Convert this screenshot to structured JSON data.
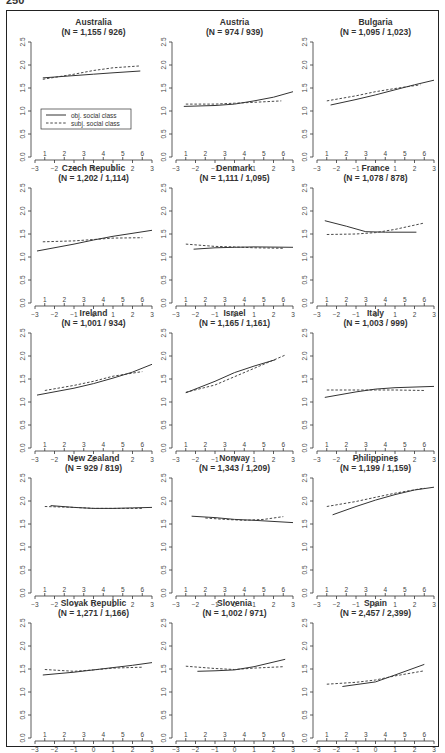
{
  "page": {
    "number": "250"
  },
  "legend": {
    "obj_label": "obj. social class",
    "subj_label": "subj. social class"
  },
  "axes": {
    "x_ticks": [
      "−3",
      "−2",
      "−1",
      "0",
      "1",
      "2",
      "3"
    ],
    "x_values": [
      -3,
      -2,
      -1,
      0,
      1,
      2,
      3
    ],
    "y_ticks": [
      "0.0",
      "0.5",
      "1.0",
      "1.5",
      "2.0",
      "2.5"
    ],
    "y_values": [
      0,
      0.5,
      1.0,
      1.5,
      2.0,
      2.5
    ],
    "class_ticks": [
      "1",
      "2",
      "3",
      "4",
      "5",
      "6"
    ],
    "class_positions": [
      -2.5,
      -1.5,
      -0.5,
      0.5,
      1.5,
      2.5
    ]
  },
  "chart_data": {
    "type": "line",
    "layout": "5x3 small multiples",
    "xlim": [
      -3,
      3
    ],
    "ylim": [
      0,
      2.5
    ],
    "secondary_x_ticks": [
      1,
      2,
      3,
      4,
      5,
      6
    ],
    "legend_position": "inside first panel, lower-middle",
    "series_names": [
      "obj. social class",
      "subj. social class"
    ],
    "panels": [
      {
        "title": "Australia",
        "n": "(N = 1,155 / 926)",
        "obj": [
          [
            -2.6,
            1.72
          ],
          [
            -1,
            1.77
          ],
          [
            0,
            1.8
          ],
          [
            1,
            1.83
          ],
          [
            2.4,
            1.87
          ]
        ],
        "subj": [
          [
            -2.6,
            1.69
          ],
          [
            -1,
            1.8
          ],
          [
            0,
            1.88
          ],
          [
            1,
            1.94
          ],
          [
            2.4,
            1.98
          ]
        ]
      },
      {
        "title": "Austria",
        "n": "(N = 974 / 939)",
        "obj": [
          [
            -2.6,
            1.1
          ],
          [
            -1,
            1.12
          ],
          [
            0,
            1.15
          ],
          [
            1,
            1.22
          ],
          [
            2,
            1.3
          ],
          [
            3,
            1.42
          ]
        ],
        "subj": [
          [
            -2.5,
            1.15
          ],
          [
            -1,
            1.15
          ],
          [
            0,
            1.17
          ],
          [
            1,
            1.19
          ],
          [
            2.4,
            1.22
          ]
        ]
      },
      {
        "title": "Bulgaria",
        "n": "(N = 1,095 / 1,023)",
        "obj": [
          [
            -2.3,
            1.13
          ],
          [
            -1,
            1.25
          ],
          [
            0,
            1.35
          ],
          [
            1,
            1.46
          ],
          [
            2,
            1.57
          ],
          [
            3,
            1.67
          ]
        ],
        "subj": [
          [
            -2.5,
            1.22
          ],
          [
            -1,
            1.33
          ],
          [
            0,
            1.42
          ],
          [
            1,
            1.49
          ],
          [
            2.3,
            1.57
          ]
        ]
      },
      {
        "title": "Czech Republic",
        "n": "(N = 1,202 / 1,114)",
        "obj": [
          [
            -2.9,
            1.13
          ],
          [
            -1,
            1.28
          ],
          [
            0,
            1.37
          ],
          [
            1,
            1.45
          ],
          [
            3,
            1.58
          ]
        ],
        "subj": [
          [
            -2.6,
            1.33
          ],
          [
            -1,
            1.35
          ],
          [
            0,
            1.38
          ],
          [
            1,
            1.41
          ],
          [
            2.5,
            1.42
          ]
        ]
      },
      {
        "title": "Denmark",
        "n": "(N = 1,111 / 1,095)",
        "obj": [
          [
            -2.1,
            1.17
          ],
          [
            -1,
            1.2
          ],
          [
            0,
            1.21
          ],
          [
            1,
            1.22
          ],
          [
            3,
            1.21
          ]
        ],
        "subj": [
          [
            -2.5,
            1.28
          ],
          [
            -1,
            1.23
          ],
          [
            0,
            1.22
          ],
          [
            1,
            1.2
          ],
          [
            2.5,
            1.19
          ]
        ]
      },
      {
        "title": "France",
        "n": "(N = 1,078 / 878)",
        "obj": [
          [
            -2.6,
            1.79
          ],
          [
            -1.5,
            1.67
          ],
          [
            -0.5,
            1.55
          ],
          [
            0.5,
            1.54
          ],
          [
            2.1,
            1.54
          ]
        ],
        "subj": [
          [
            -2.5,
            1.49
          ],
          [
            -1,
            1.5
          ],
          [
            0,
            1.53
          ],
          [
            1,
            1.6
          ],
          [
            2.5,
            1.74
          ]
        ]
      },
      {
        "title": "Ireland",
        "n": "(N = 1,001 / 934)",
        "obj": [
          [
            -2.9,
            1.15
          ],
          [
            -1,
            1.3
          ],
          [
            0,
            1.4
          ],
          [
            1,
            1.52
          ],
          [
            2,
            1.65
          ],
          [
            3,
            1.82
          ]
        ],
        "subj": [
          [
            -2.5,
            1.25
          ],
          [
            -1,
            1.36
          ],
          [
            0,
            1.45
          ],
          [
            1,
            1.56
          ],
          [
            2.5,
            1.66
          ]
        ]
      },
      {
        "title": "Israel",
        "n": "(N = 1,165 / 1,161)",
        "obj": [
          [
            -2.5,
            1.2
          ],
          [
            -1,
            1.45
          ],
          [
            0,
            1.64
          ],
          [
            1,
            1.78
          ],
          [
            2.1,
            1.92
          ]
        ],
        "subj": [
          [
            -2.5,
            1.21
          ],
          [
            -1,
            1.37
          ],
          [
            0,
            1.55
          ],
          [
            1,
            1.73
          ],
          [
            2.6,
            2.02
          ]
        ]
      },
      {
        "title": "Italy",
        "n": "(N = 1,003 / 999)",
        "obj": [
          [
            -2.6,
            1.1
          ],
          [
            -1,
            1.22
          ],
          [
            0,
            1.28
          ],
          [
            1,
            1.31
          ],
          [
            3,
            1.34
          ]
        ],
        "subj": [
          [
            -2.5,
            1.26
          ],
          [
            -1,
            1.26
          ],
          [
            0,
            1.26
          ],
          [
            1,
            1.26
          ],
          [
            2.5,
            1.25
          ]
        ]
      },
      {
        "title": "New Zealand",
        "n": "(N = 929 / 819)",
        "obj": [
          [
            -2.2,
            1.9
          ],
          [
            -1,
            1.86
          ],
          [
            0,
            1.84
          ],
          [
            1,
            1.84
          ],
          [
            2,
            1.85
          ],
          [
            3,
            1.86
          ]
        ],
        "subj": [
          [
            -2.5,
            1.88
          ],
          [
            -1,
            1.86
          ],
          [
            0,
            1.84
          ],
          [
            1,
            1.84
          ],
          [
            2.5,
            1.84
          ]
        ]
      },
      {
        "title": "Norway",
        "n": "(N = 1,343 / 1,209)",
        "obj": [
          [
            -2.2,
            1.67
          ],
          [
            -1,
            1.64
          ],
          [
            0,
            1.6
          ],
          [
            1,
            1.58
          ],
          [
            3,
            1.53
          ]
        ],
        "subj": [
          [
            -1.5,
            1.63
          ],
          [
            -0.5,
            1.6
          ],
          [
            0.5,
            1.58
          ],
          [
            1.5,
            1.6
          ],
          [
            2.5,
            1.66
          ]
        ]
      },
      {
        "title": "Philippines",
        "n": "(N = 1,199 / 1,159)",
        "obj": [
          [
            -2.2,
            1.7
          ],
          [
            -1,
            1.88
          ],
          [
            0,
            2.02
          ],
          [
            1,
            2.14
          ],
          [
            2,
            2.24
          ],
          [
            3,
            2.3
          ]
        ],
        "subj": [
          [
            -2.5,
            1.88
          ],
          [
            -1,
            1.99
          ],
          [
            0,
            2.08
          ],
          [
            1,
            2.17
          ],
          [
            2.5,
            2.28
          ]
        ]
      },
      {
        "title": "Slovak Republic",
        "n": "(N = 1,271 / 1,166)",
        "obj": [
          [
            -2.6,
            1.37
          ],
          [
            -1,
            1.43
          ],
          [
            0,
            1.48
          ],
          [
            1,
            1.53
          ],
          [
            2,
            1.58
          ],
          [
            3,
            1.64
          ]
        ],
        "subj": [
          [
            -2.5,
            1.49
          ],
          [
            -1,
            1.45
          ],
          [
            0,
            1.48
          ],
          [
            1,
            1.52
          ],
          [
            2.5,
            1.54
          ]
        ]
      },
      {
        "title": "Slovenia",
        "n": "(N = 1,002 / 971)",
        "obj": [
          [
            -1.9,
            1.45
          ],
          [
            -1,
            1.46
          ],
          [
            0,
            1.48
          ],
          [
            1,
            1.55
          ],
          [
            2.6,
            1.71
          ]
        ],
        "subj": [
          [
            -2.5,
            1.56
          ],
          [
            -1,
            1.51
          ],
          [
            0,
            1.49
          ],
          [
            1,
            1.52
          ],
          [
            2.5,
            1.55
          ]
        ]
      },
      {
        "title": "Spain",
        "n": "(N = 2,457 / 2,399)",
        "obj": [
          [
            -1.7,
            1.12
          ],
          [
            -1,
            1.16
          ],
          [
            0,
            1.22
          ],
          [
            1,
            1.37
          ],
          [
            2.5,
            1.6
          ]
        ],
        "subj": [
          [
            -2.5,
            1.17
          ],
          [
            -1,
            1.21
          ],
          [
            0,
            1.26
          ],
          [
            1,
            1.35
          ],
          [
            2.5,
            1.46
          ]
        ]
      }
    ]
  }
}
